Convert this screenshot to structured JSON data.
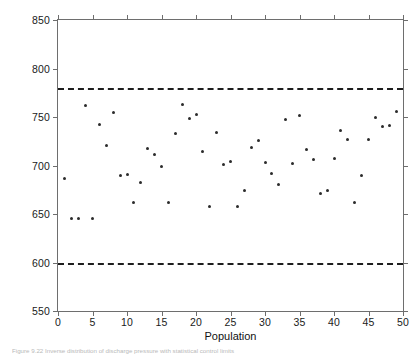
{
  "figure": {
    "caption": "Figure 9.22 Inverse distribution of discharge pressure with statistical control limits"
  },
  "chart_data": {
    "type": "scatter",
    "title": "",
    "xlabel": "Population",
    "ylabel": "Discharge pressure (kPa)",
    "xlim": [
      0,
      50
    ],
    "ylim": [
      550,
      850
    ],
    "xticks": [
      0,
      5,
      10,
      15,
      20,
      25,
      30,
      35,
      40,
      45,
      50
    ],
    "xtick_labels": [
      "0",
      "5",
      "10",
      "15",
      "20",
      "25",
      "30",
      "35",
      "40",
      "45",
      "50"
    ],
    "yticks": [
      550,
      600,
      650,
      700,
      750,
      800,
      850
    ],
    "ytick_labels": [
      "550",
      "600",
      "650",
      "700",
      "750",
      "800",
      "850"
    ],
    "grid": false,
    "legend": "none",
    "marker": "dot",
    "marker_color": "#2b2b2b",
    "limit_color": "#1d1d1d",
    "axis_color": "#6e6e6e",
    "control_limits": [
      {
        "name": "upper-control-limit",
        "value": 780,
        "style": "dashed"
      },
      {
        "name": "lower-control-limit",
        "value": 599,
        "style": "dashed"
      }
    ],
    "x": [
      1,
      2,
      3,
      4,
      5,
      6,
      7,
      8,
      9,
      10,
      11,
      12,
      13,
      14,
      15,
      16,
      17,
      18,
      19,
      20,
      21,
      22,
      23,
      24,
      25,
      26,
      27,
      28,
      29,
      30,
      31,
      32,
      33,
      34,
      35,
      36,
      37,
      38,
      39,
      40,
      41,
      42,
      43,
      44,
      45,
      46,
      47,
      48,
      49
    ],
    "y": [
      687,
      645,
      645,
      762,
      645,
      742,
      721,
      755,
      690,
      691,
      662,
      682,
      718,
      711,
      699,
      662,
      733,
      763,
      748,
      753,
      714,
      658,
      734,
      701,
      704,
      658,
      674,
      719,
      726,
      703,
      692,
      680,
      747,
      702,
      752,
      717,
      706,
      671,
      674,
      707,
      736,
      727,
      662,
      690,
      727,
      749,
      740,
      741,
      756
    ],
    "points": [
      {
        "x": 1,
        "y": 687
      },
      {
        "x": 2,
        "y": 645
      },
      {
        "x": 3,
        "y": 645
      },
      {
        "x": 4,
        "y": 762
      },
      {
        "x": 5,
        "y": 645
      },
      {
        "x": 6,
        "y": 742
      },
      {
        "x": 7,
        "y": 721
      },
      {
        "x": 8,
        "y": 755
      },
      {
        "x": 9,
        "y": 690
      },
      {
        "x": 10,
        "y": 691
      },
      {
        "x": 11,
        "y": 662
      },
      {
        "x": 12,
        "y": 682
      },
      {
        "x": 13,
        "y": 718
      },
      {
        "x": 14,
        "y": 711
      },
      {
        "x": 15,
        "y": 699
      },
      {
        "x": 16,
        "y": 662
      },
      {
        "x": 17,
        "y": 733
      },
      {
        "x": 18,
        "y": 763
      },
      {
        "x": 19,
        "y": 748
      },
      {
        "x": 20,
        "y": 753
      },
      {
        "x": 21,
        "y": 714
      },
      {
        "x": 22,
        "y": 658
      },
      {
        "x": 23,
        "y": 734
      },
      {
        "x": 24,
        "y": 701
      },
      {
        "x": 25,
        "y": 704
      },
      {
        "x": 26,
        "y": 658
      },
      {
        "x": 27,
        "y": 674
      },
      {
        "x": 28,
        "y": 719
      },
      {
        "x": 29,
        "y": 726
      },
      {
        "x": 30,
        "y": 703
      },
      {
        "x": 31,
        "y": 692
      },
      {
        "x": 32,
        "y": 680
      },
      {
        "x": 33,
        "y": 747
      },
      {
        "x": 34,
        "y": 702
      },
      {
        "x": 35,
        "y": 752
      },
      {
        "x": 36,
        "y": 717
      },
      {
        "x": 37,
        "y": 706
      },
      {
        "x": 38,
        "y": 671
      },
      {
        "x": 39,
        "y": 674
      },
      {
        "x": 40,
        "y": 707
      },
      {
        "x": 41,
        "y": 736
      },
      {
        "x": 42,
        "y": 727
      },
      {
        "x": 43,
        "y": 662
      },
      {
        "x": 44,
        "y": 690
      },
      {
        "x": 45,
        "y": 727
      },
      {
        "x": 46,
        "y": 749
      },
      {
        "x": 47,
        "y": 740
      },
      {
        "x": 48,
        "y": 741
      },
      {
        "x": 49,
        "y": 756
      }
    ]
  }
}
